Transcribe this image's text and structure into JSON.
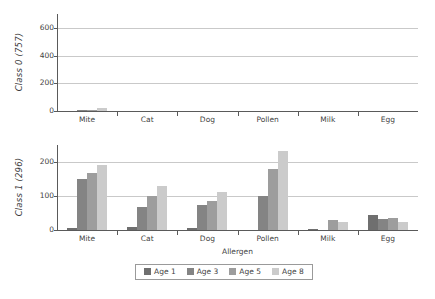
{
  "chart_data": [
    {
      "type": "bar",
      "panel": "top",
      "title": "",
      "ylabel": "Class 0 (757)",
      "xlabel": "",
      "categories": [
        "Mite",
        "Cat",
        "Dog",
        "Pollen",
        "Milk",
        "Egg"
      ],
      "yticks": [
        0,
        200,
        400,
        600
      ],
      "ylim": [
        0,
        700
      ],
      "grid": true,
      "legend_position": "bottom",
      "series": [
        {
          "name": "Age 1",
          "color": "#6f6f6f",
          "values": [
            2,
            0,
            0,
            0,
            0,
            0
          ]
        },
        {
          "name": "Age 3",
          "color": "#848484",
          "values": [
            4,
            0,
            0,
            2,
            0,
            1
          ]
        },
        {
          "name": "Age 5",
          "color": "#9d9d9d",
          "values": [
            10,
            0,
            0,
            3,
            0,
            3
          ]
        },
        {
          "name": "Age 8",
          "color": "#cbcbcb",
          "values": [
            22,
            0,
            0,
            2,
            0,
            2
          ]
        }
      ]
    },
    {
      "type": "bar",
      "panel": "bottom",
      "title": "",
      "ylabel": "Class 1 (296)",
      "xlabel": "Allergen",
      "categories": [
        "Mite",
        "Cat",
        "Dog",
        "Pollen",
        "Milk",
        "Egg"
      ],
      "yticks": [
        0,
        100,
        200
      ],
      "ylim": [
        0,
        250
      ],
      "grid": true,
      "legend_position": "bottom",
      "series": [
        {
          "name": "Age 1",
          "color": "#6f6f6f",
          "values": [
            5,
            8,
            5,
            1,
            4,
            43
          ]
        },
        {
          "name": "Age 3",
          "color": "#848484",
          "values": [
            150,
            67,
            75,
            101,
            0,
            32
          ]
        },
        {
          "name": "Age 5",
          "color": "#9d9d9d",
          "values": [
            168,
            100,
            86,
            178,
            28,
            36
          ]
        },
        {
          "name": "Age 8",
          "color": "#cbcbcb",
          "values": [
            190,
            130,
            111,
            232,
            23,
            25
          ]
        }
      ]
    }
  ],
  "legend": {
    "items": [
      {
        "label": "Age 1",
        "color": "#6f6f6f"
      },
      {
        "label": "Age 3",
        "color": "#848484"
      },
      {
        "label": "Age 5",
        "color": "#9d9d9d"
      },
      {
        "label": "Age 8",
        "color": "#cbcbcb"
      }
    ]
  }
}
